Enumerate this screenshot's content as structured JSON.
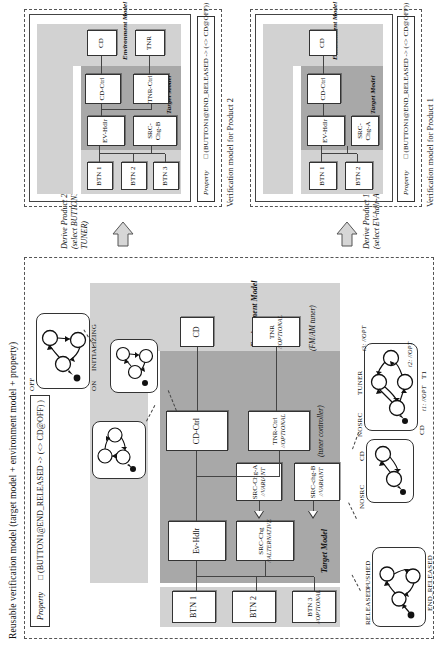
{
  "figure": {
    "title": "Reusable verification model (target model + environment model + property)"
  },
  "reusable_model": {
    "layer_labels": {
      "target_model": "Target Model",
      "environment_model": "Environment Model"
    },
    "components": {
      "btn1": "BTN 1",
      "btn2": "BTN 2",
      "btn3_name": "BTN 3",
      "btn3_stereotype": "//OPTIONAL",
      "ev_hdlr": "Ev-Hdlr",
      "src_chg_name": "SRC-Chg",
      "src_chg_stereotype": "//ALTERNATIVE",
      "src_chg_a_name": "SRC-Chg-A",
      "src_chg_a_stereotype": "//VARIANT",
      "src_chg_b_name": "SRC-chg-B",
      "src_chg_b_stereotype": "//VARIANT",
      "cd_ctrl": "CD-Ctrl",
      "tnr_ctrl_name": "TNR-Ctrl",
      "tnr_ctrl_stereotype": "//OPTIONAL",
      "cd": "CD",
      "tnr_name": "TNR",
      "tnr_stereotype": "//OPTIONAL"
    },
    "annotations": {
      "tuner_controller": "(tuner controller)",
      "fm_am_tuner": "(FM/AM tuner)"
    },
    "statecharts": {
      "button": {
        "name": "button-statechart",
        "states": [
          "RELEASED",
          "PUSHED",
          "END_RELEASED"
        ]
      },
      "cd": {
        "name": "cd-statechart",
        "states": [
          "OFF",
          "ON",
          "INITIALIZING"
        ]
      },
      "src_chg_a": {
        "name": "src-chg-a-statechart",
        "states": [
          "NOSRC",
          "CD"
        ]
      },
      "src_chg_b": {
        "name": "src-chg-b-statechart",
        "states": [
          "NOSRC",
          "CD",
          "TUNER",
          "T1"
        ],
        "transitions": [
          "t1: //OPT",
          "t2: //OPT",
          "t3: //OPT"
        ]
      },
      "ev_hdlr": {
        "name": "ev-hdlr-statechart"
      },
      "cd_ctrl": {
        "name": "cd-ctrl-statechart"
      },
      "tnr_ctrl": {
        "name": "tnr-ctrl-statechart"
      },
      "tnr": {
        "name": "tnr-statechart"
      }
    },
    "property": {
      "label": "Property",
      "value": "□ (BUTTON1@END_RELEASED -> (<> CD@OFF) )"
    }
  },
  "derivations": [
    {
      "id": "product1",
      "line1": "Derive Product 1 (CD only)",
      "line2": "(select EV-hdlr-A)"
    },
    {
      "id": "product2",
      "line1": "Derive Product 2 (CD and TUNER)",
      "line2": "(select BUTTON3, EV-hdlr-B, TUNER-Ctrl, TUNER)"
    }
  ],
  "products": [
    {
      "id": "product1",
      "caption": "Verification model for Product 1",
      "layer_labels": {
        "target_model": "Target Model",
        "environment_model": "Environment Model"
      },
      "components": {
        "btn1": "BTN 1",
        "btn2": "BTN 2",
        "ev_hdlr": "EV-Hdlr",
        "src_chg": "SRC-Chg-A",
        "cd_ctrl": "CD-Ctrl",
        "cd": "CD"
      },
      "property": {
        "label": "Property",
        "value": "□ (BUTTON1@END_RELEASED -> (<> CD@OFF))"
      }
    },
    {
      "id": "product2",
      "caption": "Verification model for Product 2",
      "layer_labels": {
        "target_model": "Target Model",
        "environment_model": "Environment Model"
      },
      "components": {
        "btn1": "BTN 1",
        "btn2": "BTN 2",
        "btn3": "BTN 3",
        "ev_hdlr": "EV-Hdlr",
        "src_chg": "SRC-Chg-B",
        "cd_ctrl": "CD-Ctrl",
        "tnr_ctrl": "TNR-Ctrl",
        "cd": "CD",
        "tnr": "TNR"
      },
      "property": {
        "label": "Property",
        "value": "□ (BUTTON1@END_RELEASED -> (<> CD@OFF))"
      }
    }
  ]
}
